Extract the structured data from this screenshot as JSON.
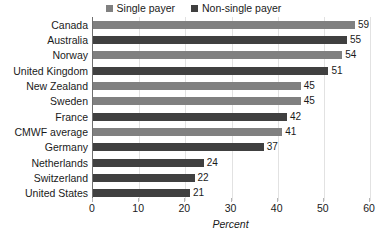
{
  "chart_data": {
    "type": "bar",
    "orientation": "horizontal",
    "title": "",
    "xlabel": "Percent",
    "ylabel": "",
    "xlim": [
      0,
      60
    ],
    "xticks": [
      0,
      10,
      20,
      30,
      40,
      50,
      60
    ],
    "grid": true,
    "legend_position": "top-center",
    "categories": [
      "Canada",
      "Australia",
      "Norway",
      "United Kingdom",
      "New Zealand",
      "Sweden",
      "France",
      "CMWF average",
      "Germany",
      "Netherlands",
      "Switzerland",
      "United States"
    ],
    "values": [
      59,
      55,
      54,
      51,
      45,
      45,
      42,
      41,
      37,
      24,
      22,
      21
    ],
    "value_labels": [
      "59",
      "55",
      "54",
      "51",
      "45",
      "45",
      "42",
      "41",
      "37",
      "24",
      "22",
      "21"
    ],
    "series_of_point": [
      "single",
      "non-single",
      "single",
      "non-single",
      "single",
      "single",
      "non-single",
      "single",
      "non-single",
      "non-single",
      "non-single",
      "non-single"
    ],
    "legend": [
      {
        "key": "single",
        "label": "Single payer",
        "color": "#808080"
      },
      {
        "key": "non-single",
        "label": "Non-single payer",
        "color": "#404040"
      }
    ],
    "colors": {
      "single": "#808080",
      "non-single": "#404040",
      "grid": "#e2e2e2",
      "axis": "#6f6f6f",
      "text": "#1a1a1a"
    }
  }
}
